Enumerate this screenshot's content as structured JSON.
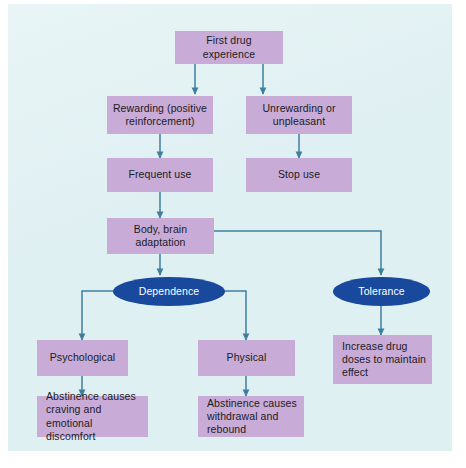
{
  "diagram": {
    "colors": {
      "panel_background": "#dff0f2",
      "box_fill": "#c8abd6",
      "ellipse_fill": "#18499c",
      "connector": "#3f7f9e",
      "box_text": "#1b1b24",
      "ellipse_text": "#ffffff"
    },
    "nodes": [
      {
        "id": "first_drug",
        "label": "First drug\nexperience",
        "shape": "box"
      },
      {
        "id": "rewarding",
        "label": "Rewarding (positive\nreinforcement)",
        "shape": "box"
      },
      {
        "id": "unrewarding",
        "label": "Unrewarding or\nunpleasant",
        "shape": "box"
      },
      {
        "id": "frequent_use",
        "label": "Frequent use",
        "shape": "box"
      },
      {
        "id": "stop_use",
        "label": "Stop use",
        "shape": "box"
      },
      {
        "id": "adaptation",
        "label": "Body, brain\nadaptation",
        "shape": "box"
      },
      {
        "id": "dependence",
        "label": "Dependence",
        "shape": "ellipse"
      },
      {
        "id": "tolerance",
        "label": "Tolerance",
        "shape": "ellipse"
      },
      {
        "id": "psychological",
        "label": "Psychological",
        "shape": "box"
      },
      {
        "id": "physical",
        "label": "Physical",
        "shape": "box"
      },
      {
        "id": "increase_doses",
        "label": "Increase drug\ndoses to maintain\neffect",
        "shape": "box"
      },
      {
        "id": "abstinence_psych",
        "label": "Abstinence causes\ncraving and\nemotional discomfort",
        "shape": "box"
      },
      {
        "id": "abstinence_phys",
        "label": "Abstinence causes\nwithdrawal and\nrebound",
        "shape": "box"
      }
    ],
    "edges": [
      {
        "from": "first_drug",
        "to": "rewarding"
      },
      {
        "from": "first_drug",
        "to": "unrewarding"
      },
      {
        "from": "rewarding",
        "to": "frequent_use"
      },
      {
        "from": "unrewarding",
        "to": "stop_use"
      },
      {
        "from": "frequent_use",
        "to": "adaptation"
      },
      {
        "from": "adaptation",
        "to": "dependence"
      },
      {
        "from": "adaptation",
        "to": "tolerance"
      },
      {
        "from": "dependence",
        "to": "psychological"
      },
      {
        "from": "dependence",
        "to": "physical"
      },
      {
        "from": "tolerance",
        "to": "increase_doses"
      },
      {
        "from": "psychological",
        "to": "abstinence_psych"
      },
      {
        "from": "physical",
        "to": "abstinence_phys"
      }
    ]
  }
}
